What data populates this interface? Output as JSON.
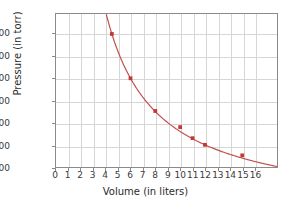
{
  "chart_data": {
    "type": "line",
    "title": "",
    "xlabel": "Volume (in liters)",
    "ylabel": "Pressure (in torr)",
    "xlim": [
      0,
      17.8
    ],
    "ylim": [
      400,
      1780
    ],
    "grid": true,
    "legend": null,
    "xticks": [
      "0",
      "1",
      "2",
      "3",
      "4",
      "5",
      "6",
      "7",
      "8",
      "9",
      "10",
      "11",
      "12",
      "13",
      "14",
      "15",
      "16"
    ],
    "xtick_values": [
      0,
      1,
      2,
      3,
      4,
      5,
      6,
      7,
      8,
      9,
      10,
      11,
      12,
      13,
      14,
      15,
      16
    ],
    "yticks": [
      "400",
      "600",
      "800",
      "1000",
      "1200",
      "1400",
      "1600"
    ],
    "ytick_values": [
      400,
      600,
      800,
      1000,
      1200,
      1400,
      1600
    ],
    "relationship": "P x V = 7200 torr-liters",
    "series": [
      {
        "name": "Pressure vs Volume",
        "color": "#c0504d",
        "marker": "square",
        "x": [
          4.5,
          6.0,
          8.0,
          10.0,
          11.0,
          12.0,
          15.0
        ],
        "values": [
          1600,
          1200,
          905,
          760,
          660,
          600,
          505
        ]
      }
    ],
    "curve": {
      "description": "P = 7200 / V",
      "constant": 7200,
      "x_start": 4.05,
      "x_end": 17.8
    }
  },
  "colors": {
    "curve": "#c0504d",
    "marker": "#bf3a32",
    "grid": "#d6d6d6",
    "axis": "#8a8a8a",
    "background": "#ffffff",
    "text": "#2b2b2b"
  }
}
